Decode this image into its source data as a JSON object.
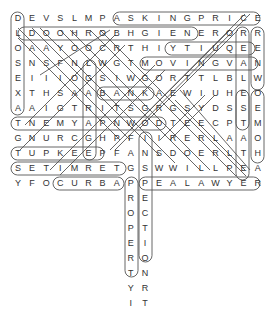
{
  "puzzle": {
    "title": "Real Estate Word Search",
    "grid": [
      "DEVSLMPASKINGPRICE",
      "LDOOHROBHGIENERORR",
      "OAAYOOCRTHIYTIUQEE",
      "SNSFNLWGTMOVINGVAN",
      "EIIIOGSIWGORTTLBLW",
      "XTHSAABANKAEWIUHEO",
      "AAIGTRITSGRGSYDSSE",
      "TNEMYAPNWODTEECPTM",
      "GNURCGHPFIIRERLAAO",
      "TUPKEEPFANSDOERLTH",
      "SETIMRETGSWWILLPEA",
      "YFOCURBAPPEALAWYER"
    ],
    "extra_columns": [
      {
        "col": 8,
        "letters": "ROPERTYI"
      },
      {
        "col": 9,
        "letters": "ECTIONRT"
      }
    ],
    "found_words": [
      {
        "word": "ASKING PRICE",
        "r1": 0,
        "c1": 7,
        "r2": 0,
        "c2": 16
      },
      {
        "word": "NEIGHBORHOOD",
        "r1": 1,
        "c1": 12,
        "r2": 1,
        "c2": 1
      },
      {
        "word": "EQUITY",
        "r1": 2,
        "c1": 16,
        "r2": 2,
        "c2": 11
      },
      {
        "word": "MOVING VAN",
        "r1": 3,
        "c1": 9,
        "r2": 3,
        "c2": 17
      },
      {
        "word": "BANK",
        "r1": 5,
        "c1": 6,
        "r2": 5,
        "c2": 9
      },
      {
        "word": "DOWN PAYMENT",
        "r1": 7,
        "c1": 10,
        "r2": 7,
        "c2": 0
      },
      {
        "word": "UPKEEP",
        "r1": 9,
        "c1": 1,
        "r2": 9,
        "c2": 6
      },
      {
        "word": "TUPKEEP",
        "r1": 9,
        "c1": 0,
        "r2": 9,
        "c2": 6
      },
      {
        "word": "TERMITES",
        "r1": 10,
        "c1": 7,
        "r2": 10,
        "c2": 0
      },
      {
        "word": "CURB APPEAL",
        "r1": 11,
        "c1": 3,
        "r2": 11,
        "c2": 11
      },
      {
        "word": "LAWYER",
        "r1": 11,
        "c1": 13,
        "r2": 11,
        "c2": 17
      },
      {
        "word": "PROPERTY",
        "r1": 11,
        "c1": 8,
        "r2": 18,
        "c2": 8
      },
      {
        "word": "INSPECTION",
        "r1": 8,
        "c1": 9,
        "r2": 17,
        "c2": 9
      },
      {
        "word": "LOANS",
        "r1": 1,
        "c1": 0,
        "r2": 3,
        "c2": 0
      },
      {
        "word": "DEED",
        "r1": 0,
        "c1": 0,
        "r2": 0,
        "c2": 0
      },
      {
        "word": "RENEW",
        "r1": 1,
        "c1": 17,
        "r2": 5,
        "c2": 17
      },
      {
        "word": "REALESTATE",
        "r1": 1,
        "c1": 16,
        "r2": 10,
        "c2": 16
      },
      {
        "word": "HOME",
        "r1": 9,
        "c1": 17,
        "r2": 6,
        "c2": 17
      },
      {
        "word": "GARAGE",
        "r1": 4,
        "c1": 5,
        "r2": 9,
        "c2": 5
      }
    ],
    "colors": {
      "letter": "#333333",
      "outline": "#555555",
      "background": "#ffffff"
    }
  }
}
